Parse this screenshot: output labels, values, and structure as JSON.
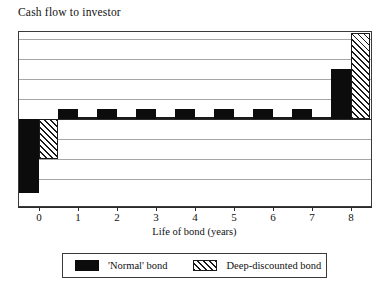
{
  "chart_data": {
    "type": "bar",
    "title": "Cash flow to investor",
    "xlabel": "Life of bond (years)",
    "ylabel": "",
    "categories": [
      "0",
      "1",
      "2",
      "3",
      "4",
      "5",
      "6",
      "7",
      "8"
    ],
    "x": [
      0,
      1,
      2,
      3,
      4,
      5,
      6,
      7,
      8
    ],
    "series": [
      {
        "name": "'Normal' bond",
        "pattern": "solid-black",
        "color": "#0c0c0c",
        "values": [
          -3.7,
          0.5,
          0.5,
          0.5,
          0.5,
          0.5,
          0.5,
          0.5,
          2.5
        ]
      },
      {
        "name": "Deep-discounted bond",
        "pattern": "diagonal-hatch",
        "color": "#1a1a1a",
        "values": [
          -2.0,
          0.12,
          0.12,
          0.12,
          0.12,
          0.12,
          0.12,
          0.12,
          4.3
        ]
      }
    ],
    "ylim": [
      -4.35,
      4.35
    ],
    "grid": true,
    "gridlines": [
      -3,
      -2,
      -1,
      1,
      2,
      3,
      4
    ],
    "zero_line": 0,
    "yaxis_ticks_visible": false,
    "legend_position": "bottom-outside"
  },
  "legend": {
    "entries": [
      {
        "label": "'Normal' bond",
        "swatch": "solid-black-swatch"
      },
      {
        "label": "Deep-discounted bond",
        "swatch": "hatched-swatch"
      }
    ]
  },
  "colors": {
    "normal_bond": "#0c0c0c",
    "deep_discounted_bond": "#1a1a1a",
    "gridline": "#a6a6a6",
    "axis": "#2b2b2b",
    "background": "#ffffff"
  }
}
